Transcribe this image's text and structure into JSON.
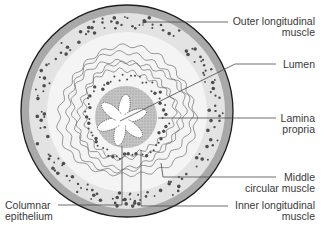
{
  "diagram": {
    "colors": {
      "outer_band": "#a9a9a9",
      "muscle_zone": "#e3e3e3",
      "inner_zone": "#f6f6f6",
      "lamina_propria": "#bcbcbc",
      "lumen": "#ffffff",
      "outline": "#1e1e1e",
      "leader_line": "#4a4a4a",
      "dots": "#555555",
      "wavy_lines": "#6e6e6e"
    },
    "labels": {
      "outer_longitudinal": {
        "line1": "Outer longitudinal",
        "line2": "muscle"
      },
      "lumen": {
        "line1": "Lumen"
      },
      "lamina_propria": {
        "line1": "Lamina",
        "line2": "propria"
      },
      "middle_circular": {
        "line1": "Middle",
        "line2": "circular muscle"
      },
      "inner_longitudinal": {
        "line1": "Inner longitudinal",
        "line2": "muscle"
      },
      "columnar_epithelium": {
        "line1": "Columnar",
        "line2": "epithelium"
      }
    }
  }
}
